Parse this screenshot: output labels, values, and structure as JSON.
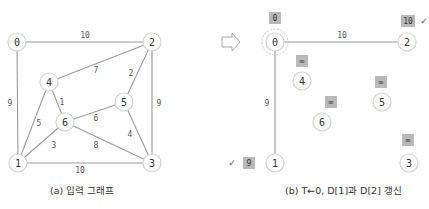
{
  "figure_a": {
    "caption": "(a) 입력 그래프",
    "nodes": [
      {
        "id": "0",
        "x": 17,
        "y": 42
      },
      {
        "id": "1",
        "x": 18,
        "y": 163
      },
      {
        "id": "2",
        "x": 152,
        "y": 42
      },
      {
        "id": "3",
        "x": 152,
        "y": 163
      },
      {
        "id": "4",
        "x": 49,
        "y": 82
      },
      {
        "id": "5",
        "x": 124,
        "y": 102
      },
      {
        "id": "6",
        "x": 65,
        "y": 122
      }
    ],
    "edges": [
      {
        "from": "0",
        "to": "2",
        "weight": "10",
        "lx": 85,
        "ly": 35
      },
      {
        "from": "0",
        "to": "1",
        "weight": "9",
        "lx": 10,
        "ly": 103
      },
      {
        "from": "2",
        "to": "4",
        "weight": "7",
        "lx": 96,
        "ly": 70
      },
      {
        "from": "2",
        "to": "5",
        "weight": "2",
        "lx": 131,
        "ly": 73
      },
      {
        "from": "2",
        "to": "3",
        "weight": "9",
        "lx": 159,
        "ly": 103
      },
      {
        "from": "4",
        "to": "6",
        "weight": "1",
        "lx": 62,
        "ly": 102
      },
      {
        "from": "4",
        "to": "1",
        "weight": "5",
        "lx": 39,
        "ly": 123
      },
      {
        "from": "6",
        "to": "5",
        "weight": "6",
        "lx": 96,
        "ly": 118
      },
      {
        "from": "5",
        "to": "3",
        "weight": "4",
        "lx": 130,
        "ly": 134
      },
      {
        "from": "6",
        "to": "1",
        "weight": "3",
        "lx": 54,
        "ly": 145
      },
      {
        "from": "6",
        "to": "3",
        "weight": "8",
        "lx": 96,
        "ly": 145
      },
      {
        "from": "1",
        "to": "3",
        "weight": "10",
        "lx": 80,
        "ly": 170
      }
    ]
  },
  "figure_b": {
    "caption": "(b) T←0, D[1]과 D[2] 갱신",
    "current_node": "0",
    "arrow_icon": "right-arrow-outline",
    "nodes": [
      {
        "id": "0",
        "x": 275,
        "y": 42,
        "dist": "0",
        "bx": 275,
        "by": 18,
        "check": ""
      },
      {
        "id": "1",
        "x": 275,
        "y": 163,
        "dist": "9",
        "bx": 249,
        "by": 163,
        "check": "✓",
        "cx": 232,
        "cy": 163
      },
      {
        "id": "2",
        "x": 407,
        "y": 42,
        "dist": "10",
        "bx": 408,
        "by": 21,
        "check": "✓",
        "cx": 424,
        "cy": 21
      },
      {
        "id": "3",
        "x": 409,
        "y": 163,
        "dist": "∞",
        "bx": 408,
        "by": 140,
        "check": ""
      },
      {
        "id": "4",
        "x": 302,
        "y": 81,
        "dist": "∞",
        "bx": 302,
        "by": 61,
        "check": ""
      },
      {
        "id": "5",
        "x": 382,
        "y": 102,
        "dist": "∞",
        "bx": 381,
        "by": 82,
        "check": ""
      },
      {
        "id": "6",
        "x": 322,
        "y": 122,
        "dist": "∞",
        "bx": 331,
        "by": 102,
        "check": ""
      }
    ],
    "edges": [
      {
        "from": "0",
        "to": "2",
        "weight": "10",
        "lx": 342,
        "ly": 35
      },
      {
        "from": "0",
        "to": "1",
        "weight": "9",
        "lx": 267,
        "ly": 103
      }
    ]
  }
}
